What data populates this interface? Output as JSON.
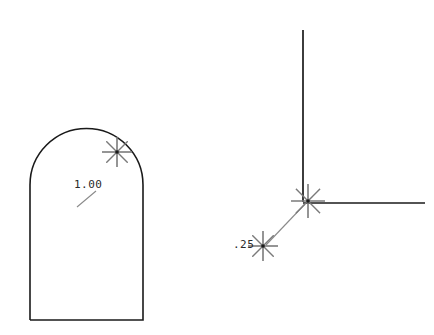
{
  "canvas": {
    "width": 434,
    "height": 335,
    "background_color": "#ffffff",
    "line_color": "#1a1a1a",
    "marker_color": "#7a7a7a",
    "leader_color": "#8a8a8a",
    "text_color": "#2a2a2a"
  },
  "figures": {
    "left": {
      "name": "arched-shape",
      "description": "Rectangle with semicircular arched top",
      "outline": {
        "left_x": 30,
        "right_x": 143,
        "bottom_y": 320,
        "spring_y": 185,
        "arc_apex_y": 146,
        "arc_radius": 56.5,
        "arc_center_x": 86.5,
        "arc_center_y": 185
      },
      "marker": {
        "name": "snap-marker-arc",
        "x": 117,
        "y": 152,
        "rays": 8,
        "ray_length": 15
      },
      "dimension": {
        "label": "1.00",
        "text_x": 74,
        "text_y": 188,
        "leader": {
          "x1": 77,
          "y1": 207,
          "x2": 96,
          "y2": 191
        }
      }
    },
    "right": {
      "name": "corner-lines",
      "description": "Vertical line meeting horizontal line at a corner",
      "vertical_line": {
        "x1": 303,
        "y1": 30,
        "x2": 303,
        "y2": 202
      },
      "horizontal_line": {
        "x1": 303,
        "y1": 203,
        "x2": 425,
        "y2": 203
      },
      "corner_marker": {
        "name": "snap-marker-corner",
        "x": 308,
        "y": 201,
        "rays": 8,
        "ray_length": 17
      },
      "offset_marker": {
        "name": "snap-marker-offset",
        "x": 263,
        "y": 246,
        "rays": 8,
        "ray_length": 15
      },
      "leader": {
        "x1": 305,
        "y1": 204,
        "x2": 266,
        "y2": 245
      },
      "dimension": {
        "label": ".25",
        "text_x": 233,
        "text_y": 248
      }
    }
  }
}
